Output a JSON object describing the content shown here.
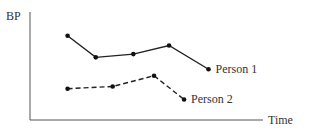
{
  "chart_data": {
    "type": "line",
    "title": "",
    "xlabel": "Time",
    "ylabel": "BP",
    "x": [
      1,
      2,
      3,
      4,
      5
    ],
    "xlim": [
      0,
      6.2
    ],
    "ylim": [
      0,
      10
    ],
    "grid": false,
    "legend": "inline-labels",
    "series": [
      {
        "name": "Person 1",
        "label": "Person 1",
        "style": "solid",
        "x": [
          1,
          1.75,
          2.75,
          3.7,
          4.75
        ],
        "values": [
          7.8,
          5.8,
          6.1,
          6.9,
          4.7
        ]
      },
      {
        "name": "Person 2",
        "label": "Person 2",
        "style": "dashed",
        "x": [
          1,
          2.2,
          3.3,
          4.1
        ],
        "values": [
          2.9,
          3.1,
          4.1,
          1.9
        ]
      }
    ]
  }
}
